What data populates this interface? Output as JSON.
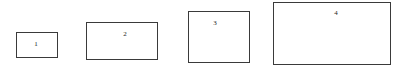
{
  "canvas": {
    "width": 402,
    "height": 75,
    "background": "#ffffff"
  },
  "style": {
    "stroke_color": "#3a3a3a",
    "stroke_width": 1,
    "fill_color": "#ffffff",
    "label_color": "#1c1c1c",
    "label_font_size": 7
  },
  "figure": {
    "type": "rectangle-size-comparison",
    "shape_count": 4
  },
  "shapes": [
    {
      "label": "1",
      "x": 16,
      "y": 32,
      "width": 42,
      "height": 26,
      "label_x": 36,
      "label_y": 44
    },
    {
      "label": "2",
      "x": 86,
      "y": 22,
      "width": 72,
      "height": 38,
      "label_x": 125,
      "label_y": 34
    },
    {
      "label": "3",
      "x": 188,
      "y": 11,
      "width": 62,
      "height": 52,
      "label_x": 215,
      "label_y": 23
    },
    {
      "label": "4",
      "x": 273,
      "y": 2,
      "width": 118,
      "height": 63,
      "label_x": 336,
      "label_y": 13
    }
  ]
}
